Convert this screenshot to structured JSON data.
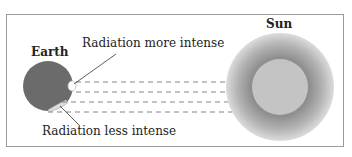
{
  "diagram": {
    "labels": {
      "earth": "Earth",
      "sun": "Sun",
      "more_intense": "Radiation more intense",
      "less_intense": "Radiation less intense"
    },
    "colors": {
      "earth": "#6b6b6b",
      "sun_outer": "#d4d4d4",
      "sun_mid": "#9a9a9a",
      "sun_core": "#c2c2c2",
      "rays": "#777777",
      "frame": "#9a9a9a"
    }
  }
}
